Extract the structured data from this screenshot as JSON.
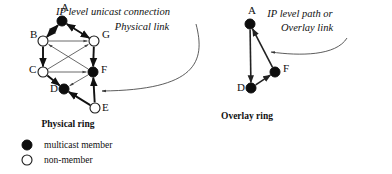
{
  "figure": {
    "width": 392,
    "height": 174,
    "background": "#ffffff",
    "ink_color": "#111111",
    "thin_edge_color": "#444444"
  },
  "panels": [
    {
      "id": "physical-ring",
      "caption": "Physical ring",
      "caption_pos": {
        "x": 68,
        "y": 127
      },
      "nodes": [
        {
          "id": "A",
          "label": "A",
          "x": 62,
          "y": 21,
          "r": 5.0,
          "type": "multicast member",
          "label_x": 61,
          "label_y": 11
        },
        {
          "id": "B",
          "label": "B",
          "x": 43,
          "y": 41,
          "r": 5.0,
          "type": "non-member",
          "label_x": 30,
          "label_y": 38
        },
        {
          "id": "G",
          "label": "G",
          "x": 94,
          "y": 41,
          "r": 5.0,
          "type": "non-member",
          "label_x": 102,
          "label_y": 38
        },
        {
          "id": "C",
          "label": "C",
          "x": 43,
          "y": 72,
          "r": 5.0,
          "type": "non-member",
          "label_x": 29,
          "label_y": 73
        },
        {
          "id": "F",
          "label": "F",
          "x": 93,
          "y": 72,
          "r": 5.0,
          "type": "multicast member",
          "label_x": 101,
          "label_y": 73
        },
        {
          "id": "D",
          "label": "D",
          "x": 64,
          "y": 89,
          "r": 5.0,
          "type": "multicast member",
          "label_x": 50,
          "label_y": 92
        },
        {
          "id": "E",
          "label": "E",
          "x": 95,
          "y": 108,
          "r": 5.0,
          "type": "non-member",
          "label_x": 102,
          "label_y": 111
        }
      ],
      "thick_edges": [
        {
          "from": "A",
          "to": "B",
          "arrow": "both"
        },
        {
          "from": "A",
          "to": "G",
          "arrow": "both"
        },
        {
          "from": "B",
          "to": "C",
          "arrow": "end"
        },
        {
          "from": "G",
          "to": "F",
          "arrow": "end"
        },
        {
          "from": "C",
          "to": "D",
          "arrow": "end"
        },
        {
          "from": "E",
          "to": "D",
          "arrow": "end"
        },
        {
          "from": "E",
          "to": "F",
          "arrow": "end"
        }
      ],
      "thin_edges": [
        {
          "from": "B",
          "to": "G",
          "arrow": "end"
        },
        {
          "from": "C",
          "to": "F",
          "arrow": "end"
        },
        {
          "from": "C",
          "to": "G",
          "arrow": "end"
        },
        {
          "from": "F",
          "to": "B",
          "arrow": "end"
        },
        {
          "from": "F",
          "to": "D",
          "arrow": "end"
        }
      ]
    },
    {
      "id": "overlay-ring",
      "caption": "Overlay ring",
      "caption_pos": {
        "x": 247,
        "y": 119
      },
      "nodes": [
        {
          "id": "A",
          "label": "A",
          "x": 250,
          "y": 24,
          "r": 5.0,
          "type": "multicast member",
          "label_x": 248,
          "label_y": 14
        },
        {
          "id": "F",
          "label": "F",
          "x": 275,
          "y": 72,
          "r": 5.0,
          "type": "multicast member",
          "label_x": 283,
          "label_y": 72
        },
        {
          "id": "D",
          "label": "D",
          "x": 251,
          "y": 88,
          "r": 5.0,
          "type": "multicast member",
          "label_x": 237,
          "label_y": 91
        }
      ],
      "overlay_edges": [
        {
          "from": "A",
          "to": "D",
          "arrow": "end"
        },
        {
          "from": "D",
          "to": "F",
          "arrow": "end"
        },
        {
          "from": "F",
          "to": "A",
          "arrow": "end"
        }
      ]
    }
  ],
  "annotations": [
    {
      "id": "physical-link-annotation",
      "lines": [
        "IP level unicast connection",
        "Physical link"
      ],
      "line_positions": [
        {
          "x": 113,
          "y": 15
        },
        {
          "x": 142,
          "y": 30
        }
      ],
      "leader_target": {
        "x": 102,
        "y": 91
      }
    },
    {
      "id": "overlay-link-annotation",
      "lines": [
        "IP level path or",
        "Overlay link"
      ],
      "line_positions": [
        {
          "x": 300,
          "y": 17
        },
        {
          "x": 307,
          "y": 31
        }
      ],
      "leader_target": {
        "x": 271,
        "y": 52
      }
    }
  ],
  "legend": {
    "title": "",
    "items": [
      {
        "symbol": "filled-circle",
        "label": "multicast member",
        "x": 27,
        "y": 145,
        "text_x": 44,
        "text_y": 148
      },
      {
        "symbol": "open-circle",
        "label": "non-member",
        "x": 27,
        "y": 160,
        "text_x": 44,
        "text_y": 163
      }
    ]
  }
}
